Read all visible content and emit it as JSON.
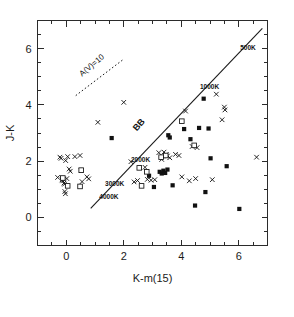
{
  "chart_data": {
    "type": "scatter",
    "title": "",
    "xlabel": "K-m(15)",
    "ylabel": "J-K",
    "xlim": [
      -1,
      7
    ],
    "ylim": [
      -1,
      7
    ],
    "xticks": [
      0,
      2,
      4,
      6
    ],
    "yticks": [
      0,
      2,
      4,
      6
    ],
    "xtick_labels": [
      "0",
      "2",
      "4",
      "6"
    ],
    "ytick_labels": [
      "0",
      "2",
      "4",
      "6"
    ],
    "grid": false,
    "legend_position": "none",
    "annotations": [
      {
        "text": "A(V)=10",
        "x": 0.55,
        "y": 5.0,
        "rotation": -40,
        "style": "extinction-vector-label"
      },
      {
        "text": "BB",
        "x": 2.45,
        "y": 3.05,
        "rotation": -48,
        "style": "blackbody-line-label"
      },
      {
        "text": "500K",
        "x": 6.05,
        "y": 5.95,
        "rotation": 0,
        "style": "temperature-label"
      },
      {
        "text": "1000K",
        "x": 4.65,
        "y": 4.55,
        "rotation": 0,
        "style": "temperature-label"
      },
      {
        "text": "2000K",
        "x": 2.25,
        "y": 1.98,
        "rotation": 0,
        "style": "temperature-label"
      },
      {
        "text": "3000K",
        "x": 1.35,
        "y": 1.12,
        "rotation": 0,
        "style": "temperature-label"
      },
      {
        "text": "4000K",
        "x": 1.15,
        "y": 0.66,
        "rotation": 0,
        "style": "temperature-label"
      }
    ],
    "lines": [
      {
        "name": "blackbody-locus",
        "label": "BB",
        "style": "solid",
        "points": [
          [
            0.85,
            0.32
          ],
          [
            6.82,
            6.72
          ]
        ]
      },
      {
        "name": "extinction-vector",
        "label": "A(V)=10",
        "style": "dashed",
        "points": [
          [
            0.33,
            4.33
          ],
          [
            1.99,
            5.62
          ]
        ]
      }
    ],
    "series": [
      {
        "name": "cross-sources",
        "marker": "x",
        "points": [
          [
            -0.3,
            1.42
          ],
          [
            -0.22,
            2.14
          ],
          [
            -0.18,
            2.1
          ],
          [
            -0.15,
            1.33
          ],
          [
            -0.12,
            1.3
          ],
          [
            -0.1,
            1.36
          ],
          [
            -0.08,
            1.22
          ],
          [
            -0.06,
            1.18
          ],
          [
            -0.05,
            0.92
          ],
          [
            -0.03,
            0.84
          ],
          [
            -0.02,
            2.02
          ],
          [
            0.02,
            1.38
          ],
          [
            0.05,
            2.16
          ],
          [
            0.1,
            1.72
          ],
          [
            0.14,
            1.64
          ],
          [
            0.3,
            2.16
          ],
          [
            0.48,
            2.2
          ],
          [
            0.52,
            1.66
          ],
          [
            0.55,
            1.27
          ],
          [
            0.72,
            1.44
          ],
          [
            0.78,
            1.37
          ],
          [
            1.1,
            3.38
          ],
          [
            2.0,
            4.09
          ],
          [
            2.25,
            1.98
          ],
          [
            2.36,
            1.26
          ],
          [
            2.48,
            1.31
          ],
          [
            2.74,
            1.78
          ],
          [
            2.82,
            1.35
          ],
          [
            2.95,
            1.32
          ],
          [
            3.08,
            1.34
          ],
          [
            3.22,
            2.3
          ],
          [
            3.32,
            2.06
          ],
          [
            3.4,
            2.32
          ],
          [
            3.48,
            2.24
          ],
          [
            3.52,
            2.18
          ],
          [
            3.6,
            2.12
          ],
          [
            3.8,
            2.24
          ],
          [
            3.92,
            2.2
          ],
          [
            4.02,
            1.44
          ],
          [
            4.15,
            3.78
          ],
          [
            4.28,
            1.3
          ],
          [
            4.38,
            2.52
          ],
          [
            4.5,
            1.38
          ],
          [
            4.55,
            2.48
          ],
          [
            5.08,
            1.34
          ],
          [
            5.22,
            4.38
          ],
          [
            5.42,
            3.47
          ],
          [
            5.5,
            3.92
          ],
          [
            5.52,
            3.82
          ],
          [
            6.62,
            2.14
          ]
        ]
      },
      {
        "name": "filled-square-sources",
        "marker": "filled-square",
        "points": [
          [
            1.58,
            2.82
          ],
          [
            2.88,
            1.48
          ],
          [
            3.05,
            1.08
          ],
          [
            3.25,
            1.62
          ],
          [
            3.32,
            1.56
          ],
          [
            3.38,
            1.66
          ],
          [
            3.44,
            1.58
          ],
          [
            3.52,
            1.7
          ],
          [
            3.55,
            2.92
          ],
          [
            3.6,
            2.84
          ],
          [
            3.7,
            1.14
          ],
          [
            4.1,
            3.14
          ],
          [
            4.32,
            2.78
          ],
          [
            4.48,
            0.42
          ],
          [
            4.62,
            3.18
          ],
          [
            4.78,
            4.22
          ],
          [
            4.84,
            0.9
          ],
          [
            4.95,
            3.16
          ],
          [
            5.02,
            2.1
          ],
          [
            5.58,
            1.82
          ],
          [
            6.02,
            0.3
          ]
        ]
      },
      {
        "name": "open-square-sources",
        "marker": "open-square",
        "points": [
          [
            -0.12,
            1.4
          ],
          [
            0.05,
            1.12
          ],
          [
            0.48,
            1.1
          ],
          [
            0.52,
            1.68
          ],
          [
            2.54,
            1.76
          ],
          [
            2.62,
            1.12
          ],
          [
            2.8,
            1.62
          ],
          [
            3.3,
            2.14
          ],
          [
            3.46,
            2.2
          ],
          [
            4.02,
            3.42
          ],
          [
            4.45,
            2.56
          ]
        ]
      }
    ]
  },
  "figure": {
    "background": "#ffffff",
    "foreground": "#111111"
  }
}
